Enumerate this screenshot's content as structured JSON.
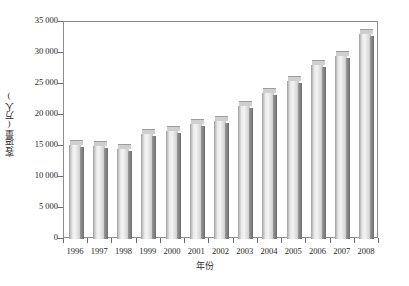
{
  "chart_data": {
    "type": "bar",
    "title": "",
    "subtitle": "",
    "xlabel": "年份",
    "ylabel": "客运量(万人)",
    "categories": [
      "1996",
      "1997",
      "1998",
      "1999",
      "2000",
      "2001",
      "2002",
      "2003",
      "2004",
      "2005",
      "2006",
      "2007",
      "2008"
    ],
    "values": [
      15100,
      15000,
      14500,
      17000,
      17500,
      18500,
      19000,
      21500,
      23500,
      25500,
      28000,
      29500,
      33000
    ],
    "series": [
      {
        "name": "客运量(万人)",
        "values": [
          15100,
          15000,
          14500,
          17000,
          17500,
          18500,
          19000,
          21500,
          23500,
          25500,
          28000,
          29500,
          33000
        ]
      }
    ],
    "ylim": [
      0,
      35000
    ],
    "ytick_values": [
      0,
      5000,
      10000,
      15000,
      20000,
      25000,
      30000,
      35000
    ],
    "ytick_labels": [
      "0",
      "5 000",
      "10 000",
      "15 000",
      "20 000",
      "25 000",
      "30 000",
      "35 000"
    ],
    "grid": false,
    "legend": false,
    "legend_position": "none",
    "bar_style": "3d-shaded-gray"
  },
  "axes": {
    "y_title": "客运量(万人)",
    "x_title": "年份"
  },
  "colors": {
    "background": "#ffffff",
    "frame": "#8d8d8d",
    "bar_face_light": "#f4f4f4",
    "bar_face_dark": "#b9b9b9",
    "bar_side": "#6e6e6e",
    "bar_top": "#cfcfcf",
    "text": "#1f1f1f",
    "tick": "#6f6f6f"
  }
}
